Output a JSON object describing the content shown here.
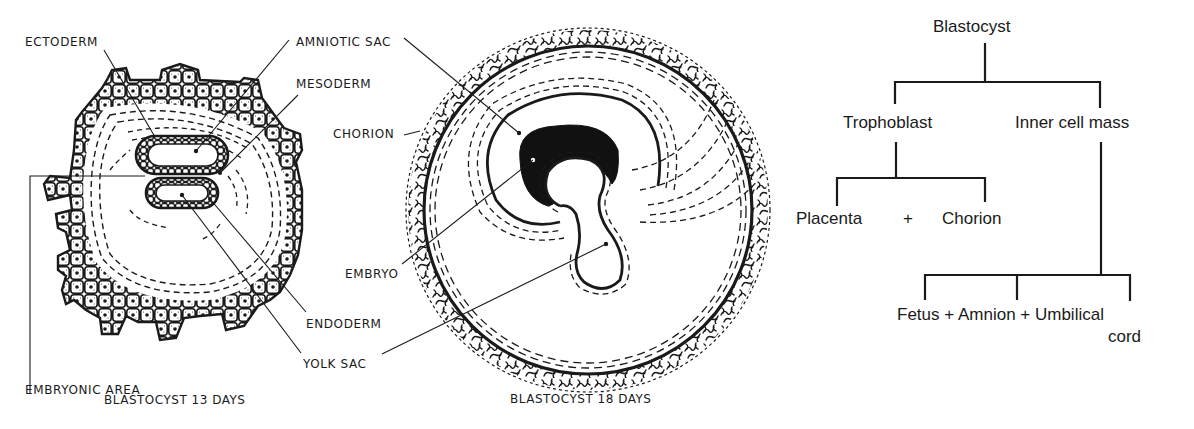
{
  "figure_13_days": {
    "caption": "BLASTOCYST 13 DAYS",
    "labels": {
      "ectoderm": "ECTODERM",
      "amniotic_sac": "AMNIOTIC SAC",
      "mesoderm": "MESODERM",
      "embryonic_area": "EMBRYONIC AREA",
      "endoderm": "ENDODERM",
      "yolk_sac": "YOLK SAC"
    }
  },
  "figure_18_days": {
    "caption": "BLASTOCYST 18 DAYS",
    "labels": {
      "chorion": "CHORION",
      "embryo": "EMBRYO"
    }
  },
  "tree": {
    "root": "Blastocyst",
    "level1": [
      "Trophoblast",
      "Inner cell mass"
    ],
    "trophoblast_children": [
      "Placenta",
      "+",
      "Chorion"
    ],
    "inner_cell_mass_children": "Fetus + Amnion + Umbilical",
    "inner_cell_mass_children_line2": "cord"
  },
  "colors": {
    "ink": "#1a1a1a",
    "background": "#ffffff"
  }
}
